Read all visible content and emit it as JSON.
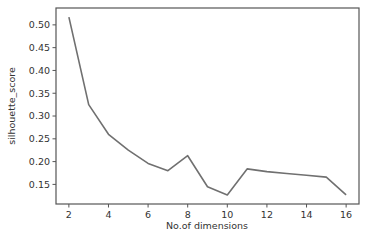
{
  "chart_data": {
    "type": "line",
    "title": "",
    "xlabel": "No.of dimensions",
    "ylabel": "silhouette_score",
    "x": [
      2,
      3,
      4,
      5,
      6,
      7,
      8,
      9,
      10,
      11,
      12,
      13,
      14,
      15,
      16
    ],
    "series": [
      {
        "name": "silhouette_score",
        "values": [
          0.517,
          0.325,
          0.26,
          0.225,
          0.196,
          0.18,
          0.213,
          0.145,
          0.127,
          0.184,
          0.178,
          0.174,
          0.17,
          0.166,
          0.127
        ]
      }
    ],
    "xticks": [
      2,
      4,
      6,
      8,
      10,
      12,
      14,
      16
    ],
    "yticks": [
      0.15,
      0.2,
      0.25,
      0.3,
      0.35,
      0.4,
      0.45,
      0.5
    ],
    "xlim": [
      1.35,
      16.65
    ],
    "ylim": [
      0.107,
      0.537
    ],
    "grid": false,
    "legend": null,
    "line_color": "#707070"
  }
}
